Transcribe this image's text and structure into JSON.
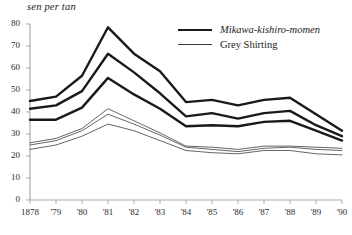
{
  "chart_data": {
    "type": "line",
    "title": "",
    "ylabel": "sen per tan",
    "xlabel": "",
    "grid": false,
    "legend_position": "top-right",
    "ylim": [
      0,
      80
    ],
    "yticks": [
      0,
      10,
      20,
      30,
      40,
      50,
      60,
      70,
      80
    ],
    "categories": [
      "1878",
      "'79",
      "'80",
      "'81",
      "'82",
      "'83",
      "'84",
      "'85",
      "'86",
      "'87",
      "'88",
      "'89",
      "'90"
    ],
    "x": [
      1878,
      1879,
      1880,
      1881,
      1882,
      1883,
      1884,
      1885,
      1886,
      1887,
      1888,
      1889,
      1890
    ],
    "legend": [
      {
        "label": "Mikawa-kishiro-momen",
        "style": "thick",
        "italic": true
      },
      {
        "label": "Grey Shirting",
        "style": "thin",
        "italic": false
      }
    ],
    "series": [
      {
        "name": "Mikawa-kishiro-momen upper",
        "style": "thick",
        "values": [
          45.0,
          47.0,
          56.5,
          78.5,
          66.5,
          58.5,
          44.5,
          45.5,
          43.0,
          45.5,
          46.5,
          39.0,
          31.5
        ]
      },
      {
        "name": "Mikawa-kishiro-momen middle",
        "style": "thick",
        "values": [
          41.5,
          43.0,
          49.5,
          66.5,
          58.0,
          48.5,
          38.0,
          39.5,
          37.0,
          39.5,
          40.5,
          34.0,
          29.0
        ]
      },
      {
        "name": "Mikawa-kishiro-momen lower",
        "style": "thick",
        "values": [
          36.5,
          36.5,
          42.0,
          55.5,
          48.0,
          41.5,
          33.5,
          34.0,
          33.5,
          35.5,
          36.0,
          31.5,
          27.0
        ]
      },
      {
        "name": "Grey Shirting upper",
        "style": "thin",
        "values": [
          26.0,
          28.0,
          32.5,
          41.5,
          36.0,
          30.5,
          24.5,
          24.0,
          23.0,
          24.5,
          24.5,
          24.0,
          23.5
        ]
      },
      {
        "name": "Grey Shirting middle",
        "style": "thin",
        "values": [
          25.0,
          27.0,
          31.5,
          39.0,
          34.5,
          29.5,
          24.0,
          23.0,
          22.0,
          23.5,
          24.0,
          23.0,
          22.5
        ]
      },
      {
        "name": "Grey Shirting lower",
        "style": "thin",
        "values": [
          23.0,
          25.0,
          29.0,
          34.5,
          31.5,
          27.0,
          22.5,
          21.5,
          21.0,
          22.5,
          22.5,
          21.0,
          20.5
        ]
      }
    ],
    "colors": {
      "thick_line": "#1a1a1a",
      "thin_line": "#4a4a4a",
      "axis": "#aaaaaa",
      "text": "#2b2b2b"
    }
  }
}
